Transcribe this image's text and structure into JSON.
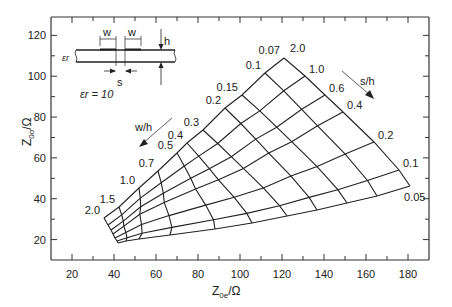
{
  "chart_data": {
    "type": "line",
    "title": "",
    "xlabel": "Z0e/Ω",
    "ylabel": "Z0o/Ω",
    "xlabel_main": "Z",
    "xlabel_sub": "0e",
    "xlabel_unit": "/Ω",
    "ylabel_main": "Z",
    "ylabel_sub": "0o",
    "ylabel_unit": "/Ω",
    "xlim": [
      10,
      190
    ],
    "ylim": [
      10,
      129
    ],
    "xticks": [
      20,
      40,
      60,
      80,
      100,
      120,
      140,
      160,
      180
    ],
    "yticks": [
      20,
      40,
      60,
      80,
      100,
      120
    ],
    "grid": false,
    "annotation_er": "εr = 10",
    "wh_arrow_label": "w/h",
    "sh_arrow_label": "s/h",
    "wh_values": [
      "0.07",
      "0.1",
      "0.15",
      "0.2",
      "0.3",
      "0.4",
      "0.5",
      "0.7",
      "1.0",
      "1.5",
      "2.0"
    ],
    "sh_values": [
      "2.0",
      "1.0",
      "0.6",
      "0.4",
      "0.2",
      "0.1",
      "0.05"
    ],
    "edge_top_sh2": [
      [
        284,
        58
      ],
      [
        265,
        73
      ],
      [
        242,
        95
      ],
      [
        225,
        108
      ],
      [
        203,
        130
      ],
      [
        187,
        143
      ],
      [
        177,
        153
      ],
      [
        158,
        171
      ],
      [
        139,
        188
      ],
      [
        119,
        207
      ],
      [
        104,
        218
      ]
    ],
    "edge_bottom_sh005": [
      [
        410,
        186
      ],
      [
        377,
        196
      ],
      [
        347,
        203
      ],
      [
        317,
        210
      ],
      [
        287,
        216
      ],
      [
        252,
        223
      ],
      [
        215,
        229
      ],
      [
        170,
        235
      ],
      [
        139,
        239
      ],
      [
        126,
        241
      ],
      [
        118,
        243
      ]
    ],
    "edge_right_wh007": [
      [
        284,
        58
      ],
      [
        305,
        76
      ],
      [
        325,
        95
      ],
      [
        343,
        112
      ],
      [
        374,
        142
      ],
      [
        399,
        170
      ],
      [
        410,
        186
      ]
    ],
    "edge_left_wh2": [
      [
        104,
        218
      ],
      [
        108,
        225
      ],
      [
        111,
        230
      ],
      [
        113,
        234
      ],
      [
        115,
        238
      ],
      [
        117,
        241
      ],
      [
        118,
        243
      ]
    ],
    "approx_values_Z0e_Z0o": {
      "wh0.07_sh2.0": [
        120,
        108
      ],
      "wh0.07_sh0.05": [
        180,
        46
      ],
      "wh2.0_sh2.0": [
        35,
        30
      ],
      "wh2.0_sh0.05": [
        42,
        18
      ]
    }
  },
  "inset": {
    "label_w1": "w",
    "label_w2": "w",
    "label_h": "h",
    "label_s": "s",
    "label_er": "εr"
  }
}
